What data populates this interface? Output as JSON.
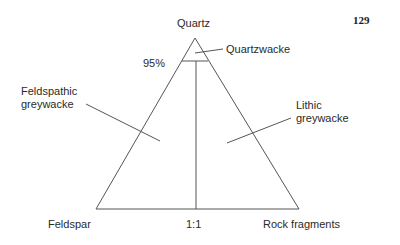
{
  "page_number": "129",
  "diagram": {
    "type": "ternary classification",
    "apex_top": "Quartz",
    "apex_left": "Feldspar",
    "apex_right": "Rock fragments",
    "threshold_label": "95%",
    "ratio_label": "1:1",
    "fields": [
      {
        "name": "Quartzwacke"
      },
      {
        "name_line1": "Feldspathic",
        "name_line2": "greywacke"
      },
      {
        "name_line1": "Lithic",
        "name_line2": "greywacke"
      }
    ]
  },
  "colors": {
    "line": "#555555",
    "text": "#2a2a2a"
  }
}
